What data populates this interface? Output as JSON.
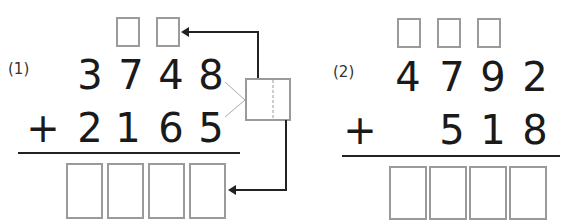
{
  "problems": [
    {
      "label": "(1)",
      "addend1": [
        "3",
        "7",
        "4",
        "8"
      ],
      "operator": "+",
      "addend2": [
        "2",
        "1",
        "6",
        "5"
      ],
      "carry_boxes": 2,
      "answer_boxes": 4,
      "helper_split_box": true
    },
    {
      "label": "(2)",
      "addend1": [
        "4",
        "7",
        "9",
        "2"
      ],
      "operator": "+",
      "addend2": [
        "",
        "5",
        "1",
        "8"
      ],
      "carry_boxes": 3,
      "answer_boxes": 4,
      "helper_split_box": false
    }
  ],
  "colors": {
    "digit": "#1a1a1a",
    "box_border": "#9a9a9a",
    "arrow": "#222222",
    "connector": "#a0a0a0"
  }
}
